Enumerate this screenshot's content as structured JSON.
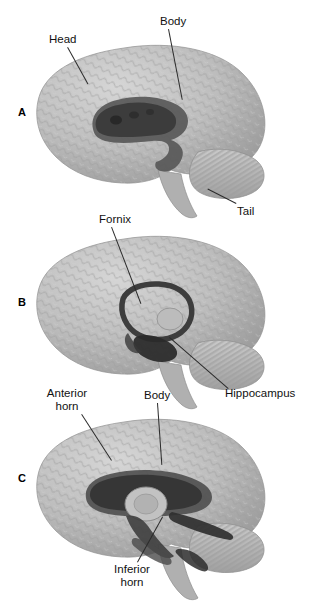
{
  "figure": {
    "type": "anatomical-illustration",
    "background_color": "#ffffff",
    "text_color": "#111111",
    "brain_fill": "#b9b9b9",
    "brain_shadow": "#8e8e8e",
    "brain_highlight": "#d4d4d4",
    "dark_structure": "#4a4a4a",
    "darker_structure": "#2e2e2e",
    "leader_color": "#2b2b2b"
  },
  "panels": [
    {
      "letter": "A",
      "subject": "caudate-nucleus",
      "labels": [
        {
          "name": "head",
          "text": "Head"
        },
        {
          "name": "body",
          "text": "Body"
        },
        {
          "name": "tail",
          "text": "Tail"
        }
      ]
    },
    {
      "letter": "B",
      "subject": "fornix-and-hippocampus",
      "labels": [
        {
          "name": "fornix",
          "text": "Fornix"
        },
        {
          "name": "hippocampus",
          "text": "Hippocampus"
        }
      ]
    },
    {
      "letter": "C",
      "subject": "lateral-ventricle",
      "labels": [
        {
          "name": "anterior-horn",
          "text": "Anterior horn"
        },
        {
          "name": "body",
          "text": "Body"
        },
        {
          "name": "inferior-horn",
          "text": "Inferior horn"
        }
      ]
    }
  ],
  "labels_flat": {
    "head": "Head",
    "body_a": "Body",
    "tail": "Tail",
    "fornix": "Fornix",
    "hippocampus": "Hippocampus",
    "anterior_horn_line1": "Anterior",
    "anterior_horn_line2": "horn",
    "body_c": "Body",
    "inferior_horn_line1": "Inferior",
    "inferior_horn_line2": "horn",
    "letter_a": "A",
    "letter_b": "B",
    "letter_c": "C"
  }
}
